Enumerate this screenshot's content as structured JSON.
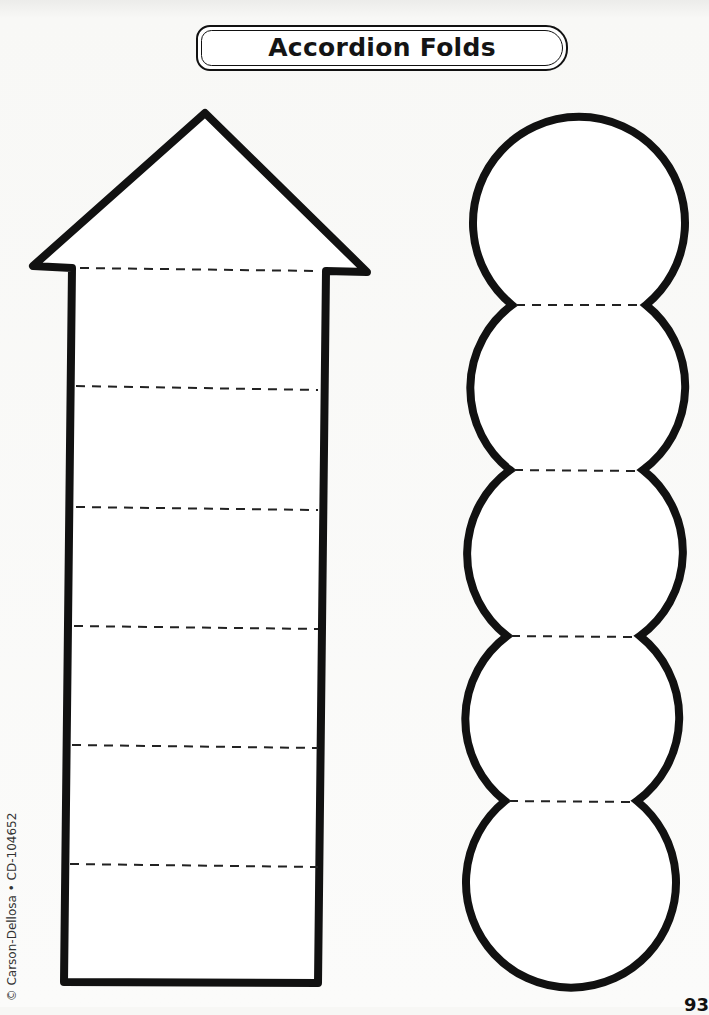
{
  "header": {
    "title": "Accordion Folds"
  },
  "arrow_template": {
    "shape": "upward-arrow",
    "fold_line_count": 6,
    "stroke_color": "#111111"
  },
  "circle_chain_template": {
    "shape": "stacked-circles",
    "circle_count": 5,
    "fold_line_count": 4,
    "stroke_color": "#111111"
  },
  "footer": {
    "copyright": "© Carson-Dellosa • CD-104652",
    "page_number": "93"
  }
}
